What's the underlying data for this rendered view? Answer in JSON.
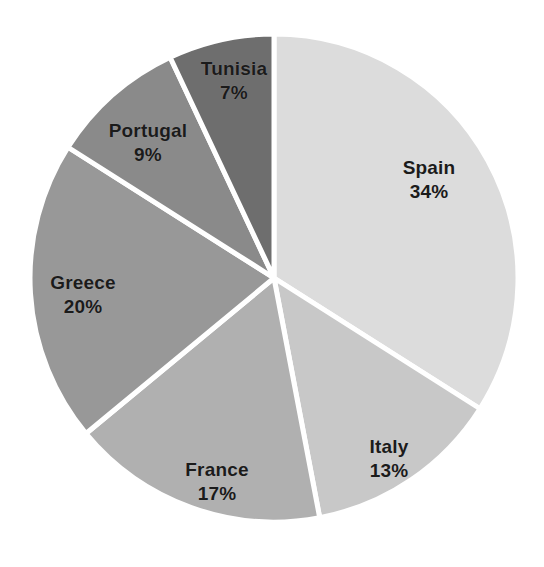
{
  "chart_data": {
    "type": "pie",
    "title": "",
    "subtitle": "",
    "xlabel": "",
    "ylabel": "",
    "legend_position": "none",
    "grid": false,
    "units": "percent",
    "start_angle_deg": 0,
    "direction": "clockwise",
    "categories": [
      "Spain",
      "Italy",
      "France",
      "Greece",
      "Portugal",
      "Tunisia"
    ],
    "values": [
      34,
      13,
      17,
      20,
      9,
      7
    ],
    "value_labels": [
      "34%",
      "13%",
      "17%",
      "20%",
      "9%",
      "7%"
    ],
    "total": 100,
    "slices": [
      {
        "name": "Spain",
        "value": 34,
        "value_label": "34%",
        "color": "#dcdcdc",
        "start_deg": 0,
        "end_deg": 122.4,
        "label_x": 429,
        "label_y": 180
      },
      {
        "name": "Italy",
        "value": 13,
        "value_label": "13%",
        "color": "#c8c8c8",
        "start_deg": 122.4,
        "end_deg": 169.2,
        "label_x": 389,
        "label_y": 459
      },
      {
        "name": "France",
        "value": 17,
        "value_label": "17%",
        "color": "#b0b0b0",
        "start_deg": 169.2,
        "end_deg": 230.4,
        "label_x": 217,
        "label_y": 482
      },
      {
        "name": "Greece",
        "value": 20,
        "value_label": "20%",
        "color": "#989898",
        "start_deg": 230.4,
        "end_deg": 302.4,
        "label_x": 83,
        "label_y": 295
      },
      {
        "name": "Portugal",
        "value": 9,
        "value_label": "9%",
        "color": "#8a8a8a",
        "start_deg": 302.4,
        "end_deg": 334.8,
        "label_x": 148,
        "label_y": 143
      },
      {
        "name": "Tunisia",
        "value": 7,
        "value_label": "7%",
        "color": "#6e6e6e",
        "start_deg": 334.8,
        "end_deg": 360,
        "label_x": 234,
        "label_y": 81
      }
    ],
    "geometry": {
      "center_x": 274,
      "center_y": 278,
      "radius": 244,
      "gap_color": "#ffffff"
    },
    "background_color": "#ffffff",
    "label_text_color": "#1b1b1b"
  }
}
